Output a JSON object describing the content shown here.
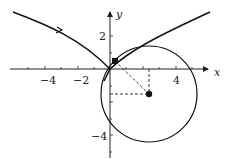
{
  "diagram": {
    "type": "evolute-osculating-circle",
    "axes": {
      "x_label": "x",
      "y_label": "y",
      "x_ticks": [
        {
          "value": -4,
          "label": "−4"
        },
        {
          "value": -2,
          "label": "−2"
        },
        {
          "value": 4,
          "label": "4"
        }
      ],
      "y_ticks": [
        {
          "value": 2,
          "label": "2"
        },
        {
          "value": -4,
          "label": "−4"
        }
      ]
    },
    "curve": {
      "description": "cusp-shaped curve through origin with direction arrow",
      "color": "#111111"
    },
    "circle": {
      "center": [
        2.35,
        -1.5
      ],
      "radius": 2.9,
      "color": "#111111"
    },
    "point_on_curve": {
      "coords": [
        0.3,
        0.45
      ],
      "marker": "square"
    },
    "center_point": {
      "coords": [
        2.35,
        -1.5
      ],
      "marker": "dot"
    },
    "dashed_lines": [
      "point-to-center",
      "center-to-x-axis",
      "center-to-y-axis"
    ]
  }
}
